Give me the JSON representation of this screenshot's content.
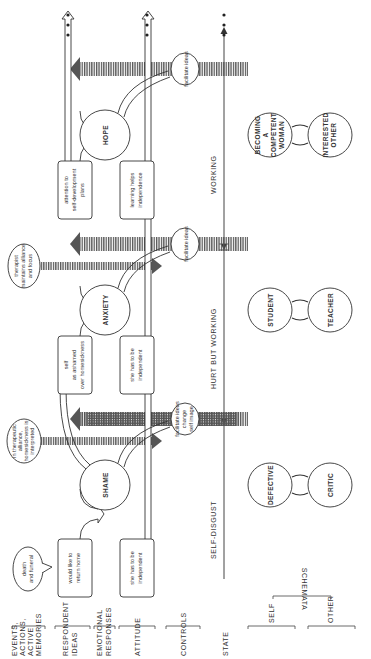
{
  "rows": {
    "events": [
      "EVENTS,",
      "ACTIONS,",
      "ACTIVE",
      "MEMORIES"
    ],
    "respondent_ideas": [
      "RESPONDENT",
      "IDEAS"
    ],
    "emotional_responses": [
      "EMOTIONAL",
      "RESPONSES"
    ],
    "attitude": "ATTITUDE",
    "controls": "CONTROLS",
    "state": "STATE",
    "schemata": "SCHEMATA",
    "self": "SELF",
    "other": "OTHER"
  },
  "phases": [
    {
      "state": "SELF-DISGUST",
      "event": [
        "death",
        "and funeral"
      ],
      "idea": [
        "would like to",
        "return home"
      ],
      "emotion": "SHAME",
      "attitude": [
        "she has to be",
        "independent"
      ],
      "control": [
        "facilitate ideas",
        "change",
        "self image"
      ],
      "therapy_note": [
        "in therapeutic",
        "alliance,",
        "homesickness is",
        "interpreted"
      ],
      "schema_self": [
        "DEFECTIVE"
      ],
      "schema_other": [
        "CRITIC"
      ]
    },
    {
      "state": "HURT BUT WORKING",
      "idea": [
        "self",
        "as ashamed",
        "over homesickness"
      ],
      "emotion": "ANXIETY",
      "attitude": [
        "she has to be",
        "independent"
      ],
      "control": [
        "facilitate ideas"
      ],
      "therapy_note": [
        "therapist",
        "maintains alliance",
        "and focus"
      ],
      "schema_self": [
        "STUDENT"
      ],
      "schema_other": [
        "TEACHER"
      ]
    },
    {
      "state": "WORKING",
      "idea": [
        "attention to",
        "self-development",
        "plans"
      ],
      "emotion": "HOPE",
      "attitude": [
        "learning helps",
        "independence"
      ],
      "control": [
        "facilitate ideas"
      ],
      "schema_self": [
        "BECOMING",
        "A",
        "COMPETENT",
        "WOMAN"
      ],
      "schema_other": [
        "INTERESTED",
        "OTHER"
      ]
    }
  ],
  "continuation": "..."
}
